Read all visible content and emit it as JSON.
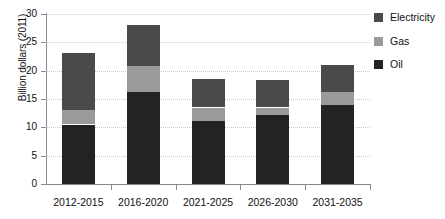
{
  "chart_data": {
    "type": "bar",
    "subtype": "stacked-bar",
    "title": "",
    "xlabel": "",
    "ylabel": "Billion dollars (2011)",
    "categories": [
      "2012-2015",
      "2016-2020",
      "2021-2025",
      "2026-2030",
      "2031-2035"
    ],
    "series": [
      {
        "name": "Oil",
        "color": "#232323",
        "values": [
          10.5,
          16.2,
          11.2,
          12.2,
          14.0
        ]
      },
      {
        "name": "Gas",
        "color": "#9a9a9a",
        "values": [
          2.6,
          4.6,
          2.3,
          1.3,
          2.2
        ]
      },
      {
        "name": "Electricity",
        "color": "#4a4a4a",
        "values": [
          10.1,
          7.3,
          5.1,
          4.8,
          4.8
        ]
      }
    ],
    "stack_totals": [
      23.2,
      28.1,
      18.6,
      18.3,
      21.0
    ],
    "ylim": [
      0,
      30
    ],
    "yticks": [
      0,
      5,
      10,
      15,
      20,
      25,
      30
    ],
    "ytick_labels": [
      "0",
      "5",
      "10",
      "15",
      "20",
      "25",
      "30"
    ],
    "grid": true,
    "grid_axis": "y",
    "grid_style": "dotted",
    "grid_color": "#c9c9c9",
    "legend_position": "right",
    "legend": [
      {
        "label": "Electricity",
        "color": "#4a4a4a"
      },
      {
        "label": "Gas",
        "color": "#9a9a9a"
      },
      {
        "label": "Oil",
        "color": "#232323"
      }
    ]
  }
}
